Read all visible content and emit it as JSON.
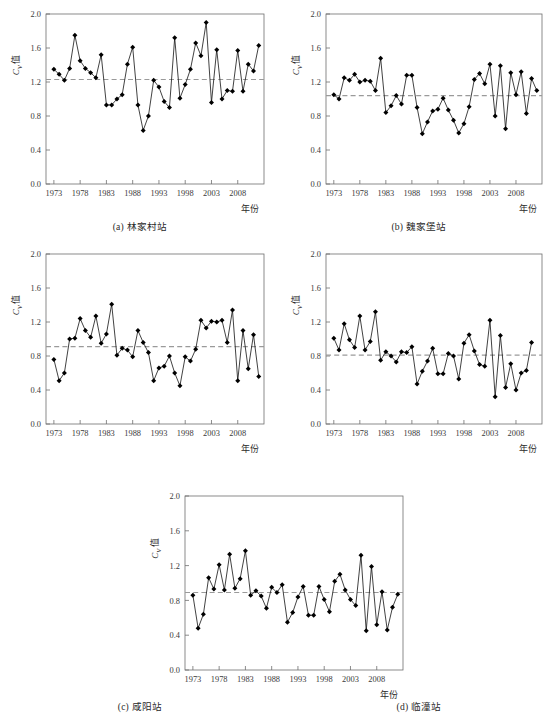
{
  "figure": {
    "axis": {
      "y_label_main": "C",
      "y_label_sub": "v",
      "y_label_tail": "值",
      "x_label": "年份",
      "y_ticks": [
        "0.0",
        "0.4",
        "0.8",
        "1.2",
        "1.6",
        "2.0"
      ],
      "y_tick_values": [
        0.0,
        0.4,
        0.8,
        1.2,
        1.6,
        2.0
      ],
      "x_ticks": [
        "1973",
        "1978",
        "1983",
        "1988",
        "1993",
        "1998",
        "2003",
        "2008"
      ],
      "x_tick_values": [
        1973,
        1978,
        1983,
        1988,
        1993,
        1998,
        2003,
        2008
      ],
      "ylim": [
        0.0,
        2.0
      ],
      "xlim": [
        1971.5,
        2013.0
      ]
    },
    "style": {
      "series_color": "#111111",
      "marker_color": "#000000",
      "mean_line_color": "#9a9a9a",
      "axis_color": "#6e6e6e",
      "background": "#ffffff"
    },
    "captions": [
      "(a) 林家村站",
      "(b) 魏家堡站",
      "(c) 咸阳站",
      "(d) 临潼站",
      "(e) 华县站"
    ]
  },
  "chart_data": [
    {
      "id": "a",
      "type": "line",
      "title": "(a) 林家村站",
      "station": "林家村站",
      "xlabel": "年份",
      "ylabel": "Cv 值",
      "ylim": [
        0.0,
        2.0
      ],
      "xlim": [
        1971.5,
        2013.0
      ],
      "grid": false,
      "legend": "none",
      "mean_line": 1.23,
      "x": [
        1973,
        1974,
        1975,
        1976,
        1977,
        1978,
        1979,
        1980,
        1981,
        1982,
        1983,
        1984,
        1985,
        1986,
        1987,
        1988,
        1989,
        1990,
        1991,
        1992,
        1993,
        1994,
        1995,
        1996,
        1997,
        1998,
        1999,
        2000,
        2001,
        2002,
        2003,
        2004,
        2005,
        2006,
        2007,
        2008,
        2009,
        2010,
        2011,
        2012
      ],
      "values": [
        1.35,
        1.29,
        1.22,
        1.36,
        1.75,
        1.45,
        1.36,
        1.31,
        1.25,
        1.52,
        0.93,
        0.93,
        1.0,
        1.05,
        1.41,
        1.61,
        0.93,
        0.63,
        0.8,
        1.22,
        1.14,
        0.97,
        0.9,
        1.72,
        1.01,
        1.17,
        1.35,
        1.66,
        1.51,
        1.9,
        0.96,
        1.58,
        1.0,
        1.1,
        1.09,
        1.57,
        1.09,
        1.41,
        1.33,
        1.63
      ],
      "series": [
        {
          "name": "Cv",
          "values": [
            1.35,
            1.29,
            1.22,
            1.36,
            1.75,
            1.45,
            1.36,
            1.31,
            1.25,
            1.52,
            0.93,
            0.93,
            1.0,
            1.05,
            1.41,
            1.61,
            0.93,
            0.63,
            0.8,
            1.22,
            1.14,
            0.97,
            0.9,
            1.72,
            1.01,
            1.17,
            1.35,
            1.66,
            1.51,
            1.9,
            0.96,
            1.58,
            1.0,
            1.1,
            1.09,
            1.57,
            1.09,
            1.41,
            1.33,
            1.63
          ]
        }
      ]
    },
    {
      "id": "b",
      "type": "line",
      "title": "(b) 魏家堡站",
      "station": "魏家堡站",
      "xlabel": "年份",
      "ylabel": "Cv 值",
      "ylim": [
        0.0,
        2.0
      ],
      "xlim": [
        1971.5,
        2013.0
      ],
      "grid": false,
      "legend": "none",
      "mean_line": 1.04,
      "x": [
        1973,
        1974,
        1975,
        1976,
        1977,
        1978,
        1979,
        1980,
        1981,
        1982,
        1983,
        1984,
        1985,
        1986,
        1987,
        1988,
        1989,
        1990,
        1991,
        1992,
        1993,
        1994,
        1995,
        1996,
        1997,
        1998,
        1999,
        2000,
        2001,
        2002,
        2003,
        2004,
        2005,
        2006,
        2007,
        2008,
        2009,
        2010,
        2011,
        2012
      ],
      "values": [
        1.05,
        1.0,
        1.25,
        1.22,
        1.29,
        1.2,
        1.22,
        1.21,
        1.1,
        1.48,
        0.84,
        0.92,
        1.04,
        0.94,
        1.28,
        1.28,
        0.9,
        0.59,
        0.73,
        0.86,
        0.88,
        1.01,
        0.87,
        0.75,
        0.6,
        0.71,
        0.91,
        1.23,
        1.3,
        1.18,
        1.41,
        0.8,
        1.39,
        0.65,
        1.31,
        1.05,
        1.32,
        0.83,
        1.24,
        1.1,
        1.52
      ],
      "series": [
        {
          "name": "Cv",
          "values": [
            1.05,
            1.0,
            1.25,
            1.22,
            1.29,
            1.2,
            1.22,
            1.21,
            1.1,
            1.48,
            0.84,
            0.92,
            1.04,
            0.94,
            1.28,
            1.28,
            0.9,
            0.59,
            0.73,
            0.86,
            0.88,
            1.01,
            0.87,
            0.75,
            0.6,
            0.71,
            0.91,
            1.23,
            1.3,
            1.18,
            1.41,
            0.8,
            1.39,
            0.65,
            1.31,
            1.05,
            1.32,
            0.83,
            1.24,
            1.1,
            1.52
          ]
        }
      ]
    },
    {
      "id": "c",
      "type": "line",
      "title": "(c) 咸阳站",
      "station": "咸阳站",
      "xlabel": "年份",
      "ylabel": "Cv 值",
      "ylim": [
        0.0,
        2.0
      ],
      "xlim": [
        1971.5,
        2013.0
      ],
      "grid": false,
      "legend": "none",
      "mean_line": 0.91,
      "x": [
        1973,
        1974,
        1975,
        1976,
        1977,
        1978,
        1979,
        1980,
        1981,
        1982,
        1983,
        1984,
        1985,
        1986,
        1987,
        1988,
        1989,
        1990,
        1991,
        1992,
        1993,
        1994,
        1995,
        1996,
        1997,
        1998,
        1999,
        2000,
        2001,
        2002,
        2003,
        2004,
        2005,
        2006,
        2007,
        2008,
        2009,
        2010,
        2011,
        2012
      ],
      "values": [
        0.76,
        0.51,
        0.6,
        1.0,
        1.01,
        1.24,
        1.1,
        1.02,
        1.27,
        0.95,
        1.06,
        1.41,
        0.81,
        0.89,
        0.87,
        0.79,
        1.1,
        0.96,
        0.84,
        0.51,
        0.66,
        0.68,
        0.8,
        0.6,
        0.45,
        0.79,
        0.74,
        0.88,
        1.22,
        1.13,
        1.21,
        1.2,
        1.22,
        0.96,
        1.34,
        0.51,
        1.1,
        0.65,
        1.05,
        0.56,
        0.82,
        0.85,
        1.19
      ],
      "series": [
        {
          "name": "Cv",
          "values": [
            0.76,
            0.51,
            0.6,
            1.0,
            1.01,
            1.24,
            1.1,
            1.02,
            1.27,
            0.95,
            1.06,
            1.41,
            0.81,
            0.89,
            0.87,
            0.79,
            1.1,
            0.96,
            0.84,
            0.51,
            0.66,
            0.68,
            0.8,
            0.6,
            0.45,
            0.79,
            0.74,
            0.88,
            1.22,
            1.13,
            1.21,
            1.2,
            1.22,
            0.96,
            1.34,
            0.51,
            1.1,
            0.65,
            1.05,
            0.56,
            0.82,
            0.85,
            1.19
          ]
        }
      ]
    },
    {
      "id": "d",
      "type": "line",
      "title": "(d) 临潼站",
      "station": "临潼站",
      "xlabel": "年份",
      "ylabel": "Cv 值",
      "ylim": [
        0.0,
        2.0
      ],
      "xlim": [
        1971.5,
        2013.0
      ],
      "grid": false,
      "legend": "none",
      "mean_line": 0.81,
      "x": [
        1973,
        1974,
        1975,
        1976,
        1977,
        1978,
        1979,
        1980,
        1981,
        1982,
        1983,
        1984,
        1985,
        1986,
        1987,
        1988,
        1989,
        1990,
        1991,
        1992,
        1993,
        1994,
        1995,
        1996,
        1997,
        1998,
        1999,
        2000,
        2001,
        2002,
        2003,
        2004,
        2005,
        2006,
        2007,
        2008,
        2009,
        2010,
        2011,
        2012
      ],
      "values": [
        1.01,
        0.87,
        1.18,
        0.99,
        0.9,
        1.27,
        0.87,
        0.97,
        1.32,
        0.75,
        0.85,
        0.8,
        0.73,
        0.85,
        0.84,
        0.91,
        0.47,
        0.62,
        0.74,
        0.89,
        0.59,
        0.59,
        0.83,
        0.8,
        0.53,
        0.95,
        1.05,
        0.86,
        0.7,
        0.68,
        1.22,
        0.32,
        1.04,
        0.43,
        0.71,
        0.4,
        0.6,
        0.63,
        0.96
      ],
      "series": [
        {
          "name": "Cv",
          "values": [
            1.01,
            0.87,
            1.18,
            0.99,
            0.9,
            1.27,
            0.87,
            0.97,
            1.32,
            0.75,
            0.85,
            0.8,
            0.73,
            0.85,
            0.84,
            0.91,
            0.47,
            0.62,
            0.74,
            0.89,
            0.59,
            0.59,
            0.83,
            0.8,
            0.53,
            0.95,
            1.05,
            0.86,
            0.7,
            0.68,
            1.22,
            0.32,
            1.04,
            0.43,
            0.71,
            0.4,
            0.6,
            0.63,
            0.96
          ]
        }
      ]
    },
    {
      "id": "e",
      "type": "line",
      "title": "(e) 华县站",
      "station": "华县站",
      "xlabel": "年份",
      "ylabel": "Cv 值",
      "ylim": [
        0.0,
        2.0
      ],
      "xlim": [
        1971.5,
        2013.0
      ],
      "grid": false,
      "legend": "none",
      "mean_line": 0.89,
      "x": [
        1973,
        1974,
        1975,
        1976,
        1977,
        1978,
        1979,
        1980,
        1981,
        1982,
        1983,
        1984,
        1985,
        1986,
        1987,
        1988,
        1989,
        1990,
        1991,
        1992,
        1993,
        1994,
        1995,
        1996,
        1997,
        1998,
        1999,
        2000,
        2001,
        2002,
        2003,
        2004,
        2005,
        2006,
        2007,
        2008,
        2009,
        2010,
        2011,
        2012
      ],
      "values": [
        0.86,
        0.48,
        0.64,
        1.06,
        0.93,
        1.21,
        0.92,
        1.33,
        0.94,
        1.05,
        1.37,
        0.86,
        0.91,
        0.85,
        0.71,
        0.95,
        0.89,
        0.98,
        0.55,
        0.66,
        0.84,
        0.96,
        0.63,
        0.63,
        0.96,
        0.81,
        0.67,
        1.02,
        1.1,
        0.92,
        0.81,
        0.74,
        1.32,
        0.45,
        1.19,
        0.52,
        0.9,
        0.46,
        0.72,
        0.87,
        1.24
      ],
      "series": [
        {
          "name": "Cv",
          "values": [
            0.86,
            0.48,
            0.64,
            1.06,
            0.93,
            1.21,
            0.92,
            1.33,
            0.94,
            1.05,
            1.37,
            0.86,
            0.91,
            0.85,
            0.71,
            0.95,
            0.89,
            0.98,
            0.55,
            0.66,
            0.84,
            0.96,
            0.63,
            0.63,
            0.96,
            0.81,
            0.67,
            1.02,
            1.1,
            0.92,
            0.81,
            0.74,
            1.32,
            0.45,
            1.19,
            0.52,
            0.9,
            0.46,
            0.72,
            0.87,
            1.24
          ]
        }
      ]
    }
  ]
}
